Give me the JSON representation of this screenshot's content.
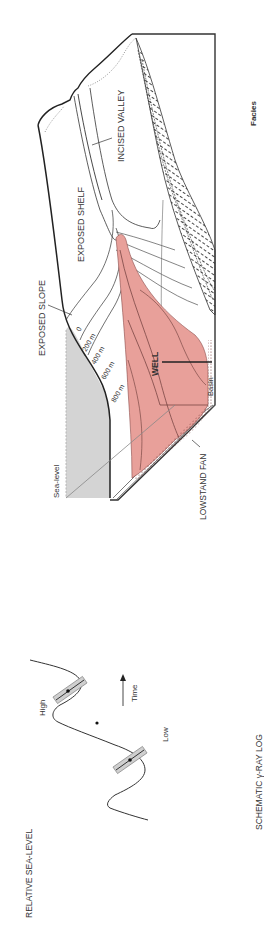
{
  "diagram": {
    "orientation": "rotated-90-ccw",
    "block": {
      "labels": {
        "exposed_slope": "EXPOSED SLOPE",
        "exposed_shelf": "EXPOSED SHELF",
        "incised_valley": "INCISED VALLEY",
        "sea_level": "Sea-level",
        "lowstand_fan": "LOWSTAND FAN",
        "well": "WELL",
        "basin": "Basin"
      },
      "contours": [
        "0",
        "200 m",
        "400 m",
        "600 m",
        "800 m"
      ]
    },
    "facies_label": "Facies",
    "sea_level_curve": {
      "title": "RELATIVE SEA-LEVEL",
      "high": "High",
      "low": "Low",
      "time": "Time"
    },
    "gamma_log_label": "SCHEMATIC γ-RAY LOG",
    "colors": {
      "fan": "#e8a09a",
      "fan_edge": "#8a4a48",
      "sea": "#d4d4d4",
      "line": "#333333"
    }
  }
}
